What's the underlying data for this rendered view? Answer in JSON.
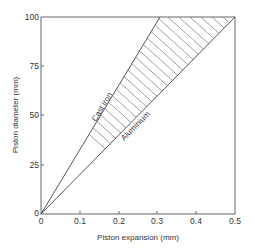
{
  "chart_data": {
    "type": "area",
    "title": "",
    "xlabel": "Piston expansion (mm)",
    "ylabel": "Piston diameter (mm)",
    "xlim": [
      0,
      0.5
    ],
    "ylim": [
      0,
      100
    ],
    "x_ticks": [
      "0",
      "0.1",
      "0.2",
      "0.3",
      "0.4",
      "0.5"
    ],
    "y_ticks": [
      "0",
      "25",
      "50",
      "75",
      "100"
    ],
    "grid": false,
    "legend": null,
    "series": [
      {
        "name": "Cast iron",
        "x": [
          0,
          0.31
        ],
        "y": [
          0,
          100
        ]
      },
      {
        "name": "Aluminium",
        "x": [
          0,
          0.5
        ],
        "y": [
          0,
          100
        ]
      }
    ],
    "annotations": [
      {
        "text": "Cast iron",
        "note": "label along upper boundary line"
      },
      {
        "text": "Aluminium",
        "note": "label along lower boundary line"
      },
      {
        "text": "hatched region between Cast iron and Aluminium lines"
      }
    ]
  },
  "labels": {
    "xlabel": "Piston expansion (mm)",
    "ylabel": "Piston diameter (mm)",
    "cast_iron": "Cast iron",
    "aluminium": "Aluminium",
    "x0": "0",
    "x1": "0.1",
    "x2": "0.2",
    "x3": "0.3",
    "x4": "0.4",
    "x5": "0.5",
    "y0": "0",
    "y25": "25",
    "y50": "50",
    "y75": "75",
    "y100": "100"
  },
  "colors": {
    "line": "#555555",
    "hatch": "#777777",
    "text": "#333333"
  }
}
